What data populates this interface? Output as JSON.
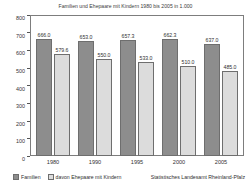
{
  "chart_data": {
    "type": "bar",
    "title": "Familien und Ehepaare mit Kindern 1980 bis 2005 in 1.000",
    "xlabel": "",
    "ylabel": "",
    "ylim": [
      0,
      800
    ],
    "yticks": [
      800,
      700,
      600,
      500,
      400,
      300,
      200,
      100,
      0
    ],
    "grid": false,
    "legend_position": "bottom-left",
    "categories": [
      "1980",
      "1990",
      "1995",
      "2000",
      "2005"
    ],
    "series": [
      {
        "name": "Familien",
        "color": "#8d8d8d",
        "values": [
          666.0,
          653.0,
          657.3,
          662.3,
          637.0
        ],
        "labels": [
          "666.0",
          "653.0",
          "657.3",
          "662.3",
          "637.0"
        ]
      },
      {
        "name": "davon Ehepaare mit Kindern",
        "color": "#dcdcdc",
        "values": [
          579.6,
          550.0,
          533.0,
          510.0,
          485.0
        ],
        "labels": [
          "579.6",
          "550.0",
          "533.0",
          "510.0",
          "485.0"
        ]
      }
    ],
    "source": "Statistisches Landesamt Rheinland-Pfalz"
  },
  "colors": {
    "series_familien": "#8d8d8d",
    "series_ehepaare": "#dcdcdc",
    "axis": "#7d7d7d",
    "text": "#2f2f2f",
    "background": "#ffffff"
  }
}
